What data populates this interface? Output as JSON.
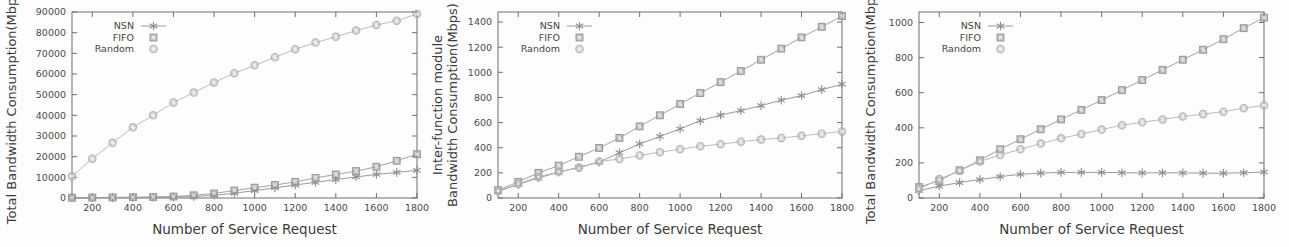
{
  "figure": {
    "panel_count": 3,
    "series_names": [
      "NSN",
      "FIFO",
      "Random"
    ],
    "colors": {
      "nsn": "#8e8e8e",
      "fifo": "#9a9a9a",
      "random": "#b4b4b4",
      "axis": "#6e6e6e",
      "text": "#3b3b3b",
      "background": "#fdfdfd"
    }
  },
  "chart_data": [
    {
      "type": "line",
      "panel": "left",
      "title": "",
      "xlabel": "Number of Service Request",
      "ylabel": "Total Bandwidth Consumption(Mbps)",
      "ylabel_lines": [
        "Total Bandwidth Consumption(Mbps)"
      ],
      "xlim": [
        100,
        1800
      ],
      "ylim": [
        0,
        90000
      ],
      "xticks": [
        200,
        400,
        600,
        800,
        1000,
        1200,
        1400,
        1600,
        1800
      ],
      "yticks": [
        0,
        10000,
        20000,
        30000,
        40000,
        50000,
        60000,
        70000,
        80000,
        90000
      ],
      "grid": false,
      "legend_position": "top-left",
      "x": [
        100,
        200,
        300,
        400,
        500,
        600,
        700,
        800,
        900,
        1000,
        1100,
        1200,
        1300,
        1400,
        1500,
        1600,
        1700,
        1800
      ],
      "series": [
        {
          "name": "NSN",
          "marker": "asterisk",
          "values": [
            100,
            150,
            200,
            260,
            330,
            420,
            700,
            1300,
            2300,
            3600,
            4900,
            6300,
            7600,
            8900,
            10200,
            11400,
            12400,
            13400
          ]
        },
        {
          "name": "FIFO",
          "marker": "square",
          "values": [
            120,
            200,
            280,
            380,
            500,
            700,
            1300,
            2200,
            3600,
            5000,
            6300,
            7800,
            9700,
            11400,
            13000,
            15100,
            18000,
            21200
          ]
        },
        {
          "name": "Random",
          "marker": "circle",
          "values": [
            10500,
            19000,
            26700,
            34200,
            40000,
            46200,
            51000,
            55900,
            60400,
            64200,
            68100,
            72000,
            75200,
            78000,
            81000,
            83700,
            85800,
            89000
          ]
        }
      ]
    },
    {
      "type": "line",
      "panel": "middle",
      "title": "",
      "xlabel": "Number of Service Request",
      "ylabel": "Inter-function module Bandwidth Consumption(Mbps)",
      "ylabel_lines": [
        "Inter-function module",
        "Bandwidth Consumption(Mbps)"
      ],
      "xlim": [
        100,
        1800
      ],
      "ylim": [
        0,
        1480
      ],
      "xticks": [
        200,
        400,
        600,
        800,
        1000,
        1200,
        1400,
        1600,
        1800
      ],
      "yticks": [
        0,
        200,
        400,
        600,
        800,
        1000,
        1200,
        1400
      ],
      "grid": false,
      "legend_position": "top-left",
      "x": [
        100,
        200,
        300,
        400,
        500,
        600,
        700,
        800,
        900,
        1000,
        1100,
        1200,
        1300,
        1400,
        1500,
        1600,
        1700,
        1800
      ],
      "series": [
        {
          "name": "NSN",
          "marker": "asterisk",
          "values": [
            52,
            108,
            160,
            205,
            245,
            285,
            360,
            430,
            490,
            550,
            615,
            660,
            695,
            735,
            778,
            815,
            862,
            905
          ]
        },
        {
          "name": "FIFO",
          "marker": "square",
          "values": [
            62,
            128,
            200,
            258,
            328,
            398,
            478,
            570,
            658,
            748,
            835,
            922,
            1010,
            1100,
            1188,
            1278,
            1362,
            1448
          ]
        },
        {
          "name": "Random",
          "marker": "circle",
          "values": [
            55,
            112,
            168,
            208,
            240,
            290,
            310,
            338,
            365,
            388,
            412,
            428,
            448,
            465,
            478,
            495,
            512,
            530
          ]
        }
      ]
    },
    {
      "type": "line",
      "panel": "right",
      "title": "",
      "xlabel": "Number of Service Request",
      "ylabel": "Total Bandwidth Consumption(Mbps)",
      "ylabel_lines": [
        "Total Bandwidth Consumption(Mbps)"
      ],
      "xlim": [
        100,
        1800
      ],
      "ylim": [
        0,
        1060
      ],
      "xticks": [
        200,
        400,
        600,
        800,
        1000,
        1200,
        1400,
        1600,
        1800
      ],
      "yticks": [
        0,
        200,
        400,
        600,
        800,
        1000
      ],
      "grid": false,
      "legend_position": "top-left",
      "x": [
        100,
        200,
        300,
        400,
        500,
        600,
        700,
        800,
        900,
        1000,
        1100,
        1200,
        1300,
        1400,
        1500,
        1600,
        1700,
        1800
      ],
      "series": [
        {
          "name": "NSN",
          "marker": "asterisk",
          "values": [
            42,
            68,
            88,
            105,
            122,
            135,
            142,
            146,
            146,
            146,
            144,
            143,
            144,
            143,
            142,
            141,
            144,
            148
          ]
        },
        {
          "name": "FIFO",
          "marker": "square",
          "values": [
            62,
            98,
            158,
            215,
            278,
            335,
            392,
            448,
            502,
            558,
            615,
            672,
            730,
            788,
            845,
            905,
            968,
            1028
          ]
        },
        {
          "name": "Random",
          "marker": "circle",
          "values": [
            50,
            108,
            155,
            208,
            245,
            278,
            310,
            340,
            365,
            390,
            415,
            432,
            448,
            465,
            478,
            492,
            512,
            528
          ]
        }
      ]
    }
  ]
}
